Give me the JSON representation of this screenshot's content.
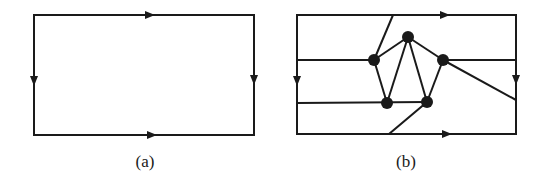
{
  "figure_a": {
    "caption": "(a)",
    "description": "Rectangle with oriented edges: top and bottom arrows point right, left and right arrows point down"
  },
  "figure_b": {
    "caption": "(b)",
    "description": "Same oriented rectangle with an embedded graph: five vertices forming a pentagon-like cluster connected by edges to the rectangle sides",
    "vertices": 5
  },
  "colors": {
    "stroke": "#1a1a1a",
    "background": "#ffffff"
  }
}
